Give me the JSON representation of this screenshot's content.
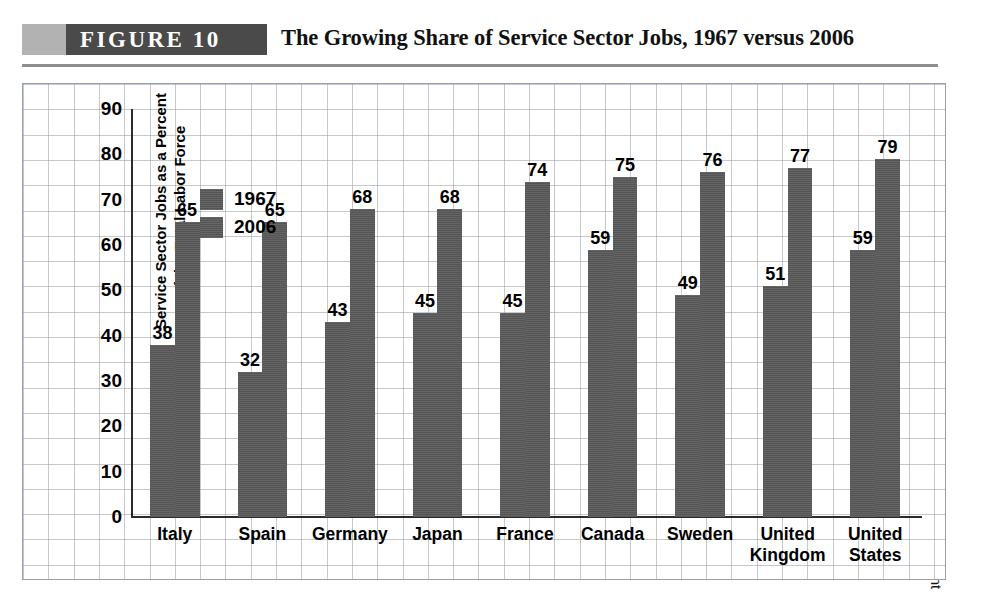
{
  "header": {
    "figure_tag": "FIGURE   10",
    "title": "The Growing Share of Service Sector Jobs, 1967 versus 2006"
  },
  "source": {
    "text": "SOURCE: Organisation for Economic Co-operation and Development"
  },
  "colors": {
    "bar": "#595959",
    "banner": "#4a4a4a",
    "banner_tab": "#b2b2b2",
    "rule": "#8d8d8d",
    "grid": "#969baa",
    "axis": "#2b2b2b"
  },
  "chart_data": {
    "type": "bar",
    "title": "The Growing Share of Service Sector Jobs, 1967 versus 2006",
    "xlabel": "",
    "ylabel": "Service Sector Jobs as a Percent of the Total Labor Force",
    "ylabel_lines": [
      "Service Sector Jobs as a Percent",
      "of the Total Labor Force"
    ],
    "ylim": [
      0,
      90
    ],
    "yticks": [
      90,
      80,
      70,
      60,
      50,
      40,
      30,
      20,
      10,
      0
    ],
    "grid": true,
    "legend_position": "top-left",
    "categories": [
      "Italy",
      "Spain",
      "Germany",
      "Japan",
      "France",
      "Canada",
      "Sweden",
      "United Kingdom",
      "United States"
    ],
    "category_lines": [
      [
        "Italy"
      ],
      [
        "Spain"
      ],
      [
        "Germany"
      ],
      [
        "Japan"
      ],
      [
        "France"
      ],
      [
        "Canada"
      ],
      [
        "Sweden"
      ],
      [
        "United",
        "Kingdom"
      ],
      [
        "United",
        "States"
      ]
    ],
    "series": [
      {
        "name": "1967",
        "values": [
          38,
          32,
          43,
          45,
          45,
          59,
          49,
          51,
          59
        ]
      },
      {
        "name": "2006",
        "values": [
          65,
          65,
          68,
          68,
          74,
          75,
          76,
          77,
          79
        ]
      }
    ]
  }
}
